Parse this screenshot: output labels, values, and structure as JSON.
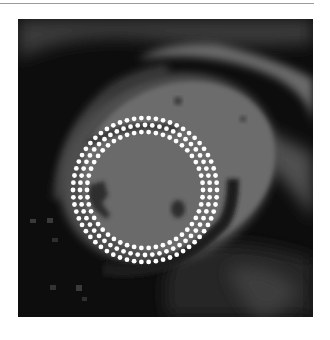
{
  "figure": {
    "frame": {
      "x": 18,
      "y": 19,
      "width": 295,
      "height": 298
    },
    "colors": {
      "background": "#0d0d0d",
      "blood_pool": "#6e6e6e",
      "myocardium_edge": "#555555",
      "bright_tissue": "#8a8a8a",
      "dark_spot": "#2a2a2a",
      "dot": "#ffffff"
    },
    "contour_overlay": {
      "center": {
        "x": 127,
        "y": 171
      },
      "rings": [
        {
          "name": "outer",
          "radius": 72,
          "dot_count": 62
        },
        {
          "name": "middle",
          "radius": 65,
          "dot_count": 56
        },
        {
          "name": "inner",
          "radius": 58,
          "dot_count": 50
        }
      ],
      "dot_radius": 2.4
    }
  }
}
